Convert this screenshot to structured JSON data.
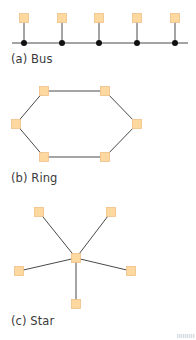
{
  "colors": {
    "node_fill": "#FDD9A0",
    "node_stroke": "#EFC088",
    "line": "#4a4a4a",
    "bus_dot": "#111111",
    "label": "#3a3a3a"
  },
  "node_size": 9,
  "diagrams": [
    {
      "id": "bus",
      "label": "(a) Bus",
      "bus_line": {
        "x1": 12,
        "x2": 188,
        "y": 43
      },
      "nodes": [
        {
          "x": 24,
          "y": 18
        },
        {
          "x": 62,
          "y": 18
        },
        {
          "x": 99,
          "y": 18
        },
        {
          "x": 137,
          "y": 18
        },
        {
          "x": 175,
          "y": 18
        }
      ]
    },
    {
      "id": "ring",
      "label": "(b) Ring",
      "nodes": [
        {
          "x": 44,
          "y": 91
        },
        {
          "x": 105,
          "y": 91
        },
        {
          "x": 137,
          "y": 124
        },
        {
          "x": 105,
          "y": 157
        },
        {
          "x": 44,
          "y": 157
        },
        {
          "x": 16,
          "y": 124
        }
      ]
    },
    {
      "id": "star",
      "label": "(c) Star",
      "hub": {
        "x": 76,
        "y": 258
      },
      "nodes": [
        {
          "x": 39,
          "y": 212
        },
        {
          "x": 111,
          "y": 212
        },
        {
          "x": 131,
          "y": 271
        },
        {
          "x": 76,
          "y": 304
        },
        {
          "x": 19,
          "y": 271
        }
      ]
    }
  ],
  "labels": {
    "bus": "(a) Bus",
    "ring": "(b) Ring",
    "star": "(c) Star"
  }
}
